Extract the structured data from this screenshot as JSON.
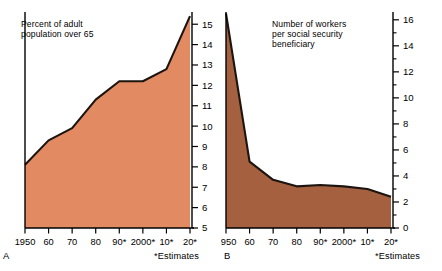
{
  "figure": {
    "background": "#ffffff",
    "panels": [
      {
        "id": "A",
        "letter": "A",
        "caption": "Percent of adult\npopulation over 65",
        "estimates_note": "*Estimates",
        "fill_color": "#e28b63",
        "line_color": "#1c1410"
      },
      {
        "id": "B",
        "letter": "B",
        "caption": "Number of workers\nper social security\nbeneficiary",
        "estimates_note": "*Estimates",
        "fill_color": "#a5613f",
        "line_color": "#1c1410"
      }
    ]
  },
  "chart_data": [
    {
      "type": "area",
      "title": "Percent of adult population over 65",
      "panel": "A",
      "xlabel": "",
      "ylabel": "",
      "x": [
        "1950",
        "60",
        "70",
        "80",
        "90*",
        "2000*",
        "10*",
        "20*"
      ],
      "xticklabels": [
        "1950",
        "60",
        "70",
        "80",
        "90*",
        "2000*",
        "10*",
        "20*"
      ],
      "values": [
        8.1,
        9.3,
        9.9,
        11.3,
        12.2,
        12.2,
        12.8,
        15.4
      ],
      "ylim": [
        5,
        15.6
      ],
      "yticks": [
        5,
        6,
        7,
        8,
        9,
        10,
        11,
        12,
        13,
        14,
        15
      ],
      "yticklabels": [
        "5",
        "6",
        "7",
        "8",
        "9",
        "10",
        "11",
        "12",
        "13",
        "14",
        "15"
      ],
      "grid": false,
      "legend": "none",
      "annotations": [
        "*Estimates"
      ],
      "baseline": 5
    },
    {
      "type": "area",
      "title": "Number of workers per social security beneficiary",
      "panel": "B",
      "xlabel": "",
      "ylabel": "",
      "x": [
        "1950",
        "60",
        "70",
        "80",
        "90*",
        "2000*",
        "10*",
        "20*"
      ],
      "xticklabels": [
        "1950",
        "60",
        "70",
        "80",
        "90*",
        "2000*",
        "10*",
        "20*"
      ],
      "values": [
        16.5,
        5.1,
        3.7,
        3.2,
        3.3,
        3.2,
        3.0,
        2.4
      ],
      "ylim": [
        0,
        16.6
      ],
      "yticks": [
        0,
        1,
        2,
        3,
        4,
        5,
        6,
        7,
        8,
        9,
        10,
        11,
        12,
        13,
        14,
        15,
        16
      ],
      "yticklabels_major": [
        "0",
        "2",
        "4",
        "6",
        "8",
        "10",
        "12",
        "14",
        "16"
      ],
      "grid": false,
      "legend": "none",
      "annotations": [
        "*Estimates"
      ],
      "baseline": 0
    }
  ]
}
